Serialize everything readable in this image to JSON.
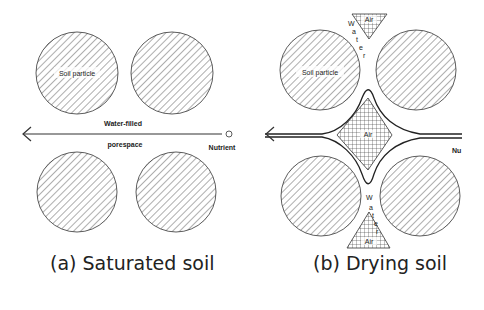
{
  "panels": [
    {
      "id": "a",
      "caption": "(a) Saturated soil",
      "labels": {
        "soil_particle": "Soil particle",
        "water_filled": "Water-filled",
        "porespace": "porespace",
        "nutrient": "Nutrient"
      }
    },
    {
      "id": "b",
      "caption": "(b) Drying soil",
      "labels": {
        "soil_particle": "Soil particle",
        "air_top": "Air",
        "air_center": "Air",
        "air_bottom": "Air",
        "water_top": [
          "W",
          "a",
          "t",
          "e",
          "r"
        ],
        "water_bottom": [
          "W",
          "a",
          "t",
          "e",
          "r"
        ],
        "nutrient": "Nu"
      }
    }
  ],
  "colors": {
    "ink": "#222222",
    "background": "#ffffff"
  }
}
